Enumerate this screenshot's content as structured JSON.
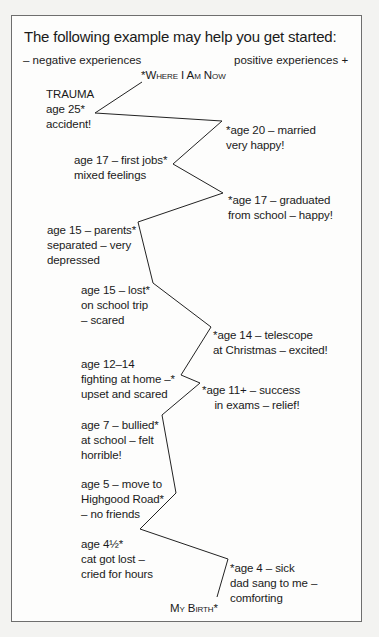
{
  "header": {
    "title": "The following example may help you get started:",
    "negative_label": "– negative experiences",
    "positive_label": "positive experiences +"
  },
  "lifeline": {
    "end_label": "*Where I Am Now",
    "start_label": "My Birth*",
    "events": [
      {
        "id": "trauma",
        "side": "negative",
        "text": "TRAUMA\nage 25*\naccident!"
      },
      {
        "id": "married",
        "side": "positive",
        "text": "*age 20 – married\nvery happy!"
      },
      {
        "id": "first-jobs",
        "side": "negative",
        "text": "age 17 – first jobs*\nmixed feelings"
      },
      {
        "id": "graduated",
        "side": "positive",
        "text": "*age 17 – graduated\nfrom school – happy!"
      },
      {
        "id": "parents-separated",
        "side": "negative",
        "text": "age 15 – parents*\nseparated – very\ndepressed"
      },
      {
        "id": "lost-school-trip",
        "side": "negative",
        "text": "age 15 – lost*\non school trip\n– scared"
      },
      {
        "id": "telescope",
        "side": "positive",
        "text": "*age 14 – telescope\nat Christmas – excited!"
      },
      {
        "id": "fighting-home",
        "side": "negative",
        "text": "age 12–14\nfighting at home –*\nupset and scared"
      },
      {
        "id": "exams",
        "side": "positive",
        "text": "*age 11+ – success\n    in exams – relief!"
      },
      {
        "id": "bullied",
        "side": "negative",
        "text": "age 7 – bullied*\nat school – felt\nhorrible!"
      },
      {
        "id": "move-highgood",
        "side": "negative",
        "text": "age 5 – move to\nHighgood Road*\n– no friends"
      },
      {
        "id": "cat-lost",
        "side": "negative",
        "text": "age 4½*\ncat got lost –\ncried for hours"
      },
      {
        "id": "sick-dad-sang",
        "side": "positive",
        "text": "*age 4 – sick\ndad sang to me –\ncomforting"
      }
    ],
    "line_points": "142,82 95,113 222,121 173,164 223,193 138,222 153,283 211,327 181,375 200,383 162,415 176,493 140,529 228,559 217,597",
    "line_color": "#222222"
  }
}
